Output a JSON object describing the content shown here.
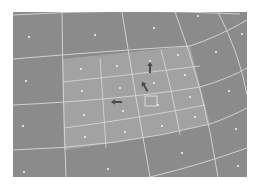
{
  "diagram": {
    "type": "curved-grid",
    "colors": {
      "background": "#ffffff",
      "coarse_fill": "#8b8b8b",
      "refined_fill": "#a2a2a2",
      "grid_line": "#d8d8d8",
      "point": "#f0f0f0",
      "arrow": "#4a4a4a"
    },
    "frame": {
      "x": 13,
      "y": 12,
      "width": 234,
      "height": 165
    },
    "coarse_points": [
      [
        29,
        37
      ],
      [
        95,
        35
      ],
      [
        154,
        28
      ],
      [
        198,
        16
      ],
      [
        242,
        34
      ],
      [
        216,
        52
      ],
      [
        26,
        81
      ],
      [
        229,
        91
      ],
      [
        23,
        126
      ],
      [
        236,
        129
      ],
      [
        182,
        153
      ],
      [
        24,
        172
      ],
      [
        108,
        169
      ],
      [
        238,
        166
      ]
    ],
    "refined_points": [
      [
        81,
        69
      ],
      [
        117,
        66
      ],
      [
        150,
        61
      ],
      [
        178,
        55
      ],
      [
        82,
        91
      ],
      [
        120,
        88
      ],
      [
        154,
        83
      ],
      [
        185,
        75
      ],
      [
        84,
        115
      ],
      [
        123,
        111
      ],
      [
        158,
        105
      ],
      [
        190,
        97
      ],
      [
        85,
        137
      ],
      [
        125,
        132
      ],
      [
        162,
        126
      ],
      [
        195,
        117
      ]
    ],
    "arrows": [
      {
        "name": "arrow-up",
        "x": 150,
        "y": 68,
        "rotation": -90
      },
      {
        "name": "arrow-diagonal",
        "x": 145,
        "y": 87,
        "rotation": -120
      },
      {
        "name": "arrow-left",
        "x": 117,
        "y": 102,
        "rotation": 180
      }
    ],
    "marker_square": {
      "x": 145,
      "y": 96,
      "width": 12,
      "height": 10
    }
  }
}
